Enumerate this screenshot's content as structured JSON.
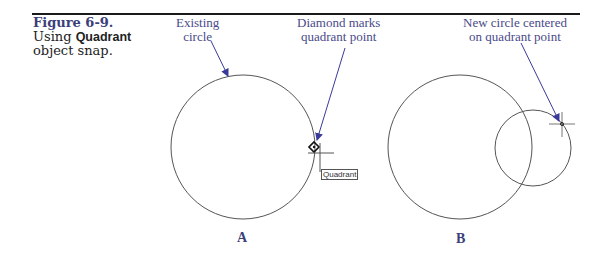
{
  "figure": {
    "number": "Figure 6-9.",
    "caption_prefix": "Using ",
    "caption_bold": "Quadrant",
    "caption_line2": "object snap."
  },
  "annotations": {
    "existing_circle": [
      "Existing",
      "circle"
    ],
    "diamond_marks": [
      "Diamond marks",
      "quadrant point"
    ],
    "new_circle": [
      "New circle centered",
      "on quadrant point"
    ]
  },
  "tooltip": {
    "text": "Quadrant"
  },
  "panels": [
    {
      "letter": "A"
    },
    {
      "letter": "B"
    }
  ],
  "colors": {
    "rule": "#1a1a1a",
    "figure_number": "#3b3f7a",
    "annotation_text": "#4a4a8a",
    "leader_arrow": "#3a3a9a",
    "geometry": "#555555"
  }
}
